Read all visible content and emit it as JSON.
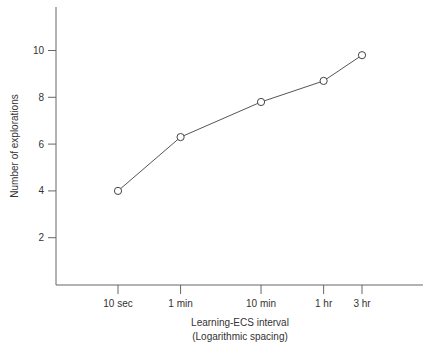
{
  "chart_data": {
    "type": "line",
    "title": "",
    "xlabel": "Learning-ECS interval",
    "xlabel_sub": "(Logarithmic spacing)",
    "ylabel": "Number of explorations",
    "categories": [
      "10 sec",
      "1 min",
      "10 min",
      "1 hr",
      "3 hr"
    ],
    "x_positions_log_seconds": [
      1.0,
      1.778,
      2.778,
      3.556,
      4.033
    ],
    "series": [
      {
        "name": "Number of explorations",
        "values": [
          4.0,
          6.3,
          7.8,
          8.7,
          9.8
        ],
        "marker": "open-circle"
      }
    ],
    "yticks": [
      2,
      4,
      6,
      8,
      10
    ],
    "ylim": [
      0,
      11.7
    ],
    "grid": false,
    "legend": "none"
  }
}
